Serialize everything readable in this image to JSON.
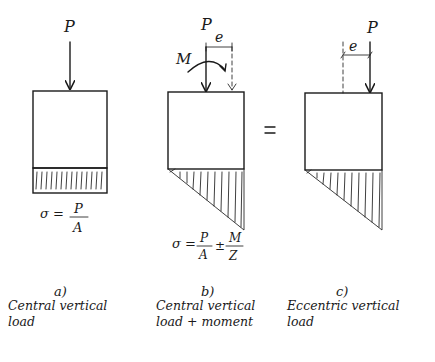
{
  "diagram": {
    "panels": [
      {
        "id": "a",
        "letter": "a)",
        "caption_line1": "Central vertical",
        "caption_line2": "load",
        "load_label": "P",
        "formula": {
          "lhs": "σ =",
          "num": "P",
          "den": "A"
        },
        "stress_distribution": "uniform"
      },
      {
        "id": "b",
        "letter": "b)",
        "caption_line1": "Central vertical",
        "caption_line2": "load + moment",
        "load_label": "P",
        "moment_label": "M",
        "eccentricity_label": "e",
        "formula": {
          "lhs": "σ =",
          "num1": "P",
          "den1": "A",
          "op": "±",
          "num2": "M",
          "den2": "Z"
        },
        "stress_distribution": "triangular"
      },
      {
        "id": "c",
        "letter": "c)",
        "caption_line1": "Eccentric vertical",
        "caption_line2": "load",
        "load_label": "P",
        "eccentricity_label": "e",
        "stress_distribution": "triangular"
      }
    ],
    "equals_sign": "="
  }
}
